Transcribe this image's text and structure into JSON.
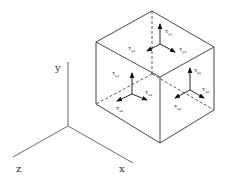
{
  "diagram": {
    "axes": {
      "x": "x",
      "y": "y",
      "z": "z"
    },
    "faces": {
      "top": {
        "normal": "y",
        "symbol": "τ",
        "components": [
          {
            "sub": "yy",
            "direction": "up"
          },
          {
            "sub": "yz",
            "direction": "left-down"
          },
          {
            "sub": "yx",
            "direction": "right-down"
          }
        ]
      },
      "front_left": {
        "normal": "z",
        "symbol": "τ",
        "components": [
          {
            "sub": "zy",
            "direction": "up"
          },
          {
            "sub": "zz",
            "direction": "left-down"
          },
          {
            "sub": "zx",
            "direction": "right-down"
          }
        ]
      },
      "front_right": {
        "normal": "x",
        "symbol": "τ",
        "components": [
          {
            "sub": "xy",
            "direction": "up"
          },
          {
            "sub": "xz",
            "direction": "left-down"
          },
          {
            "sub": "xx",
            "direction": "right-down"
          }
        ]
      }
    },
    "colors": {
      "line": "#333333",
      "background": "#ffffff"
    }
  }
}
